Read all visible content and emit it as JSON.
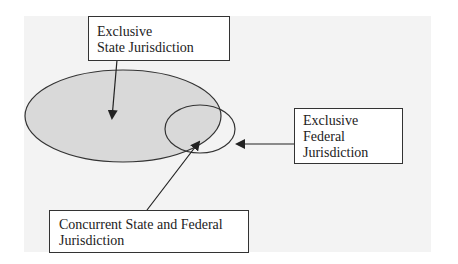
{
  "diagram": {
    "labels": {
      "state": {
        "line1": "Exclusive",
        "line2": "State Jurisdiction"
      },
      "federal": {
        "line1": "Exclusive",
        "line2": "Federal",
        "line3": "Jurisdiction"
      },
      "concurrent": {
        "line1": "Concurrent State and Federal",
        "line2": "Jurisdiction"
      }
    },
    "colors": {
      "state_ellipse_fill": "#d9d9d9",
      "outline": "#333333",
      "background_panel": "#f3f3f3"
    }
  }
}
